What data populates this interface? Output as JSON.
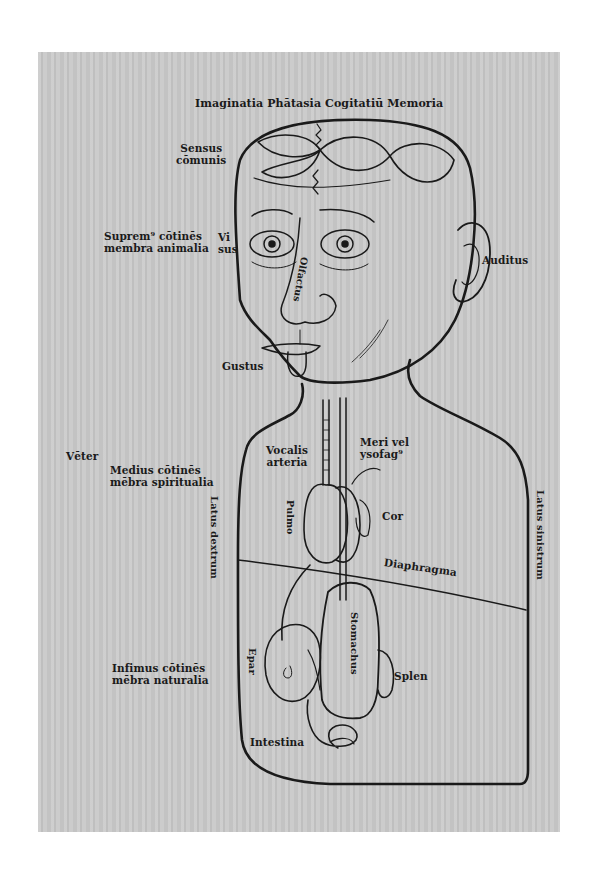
{
  "illustration": {
    "type": "woodcut anatomical diagram",
    "colors": {
      "page_background": "#ffffff",
      "paper": "#c9c9c9",
      "ink": "#1a1a1a"
    },
    "labels": {
      "brain_ventricles": "Imaginatia Phātasia Cogitatiū Memoria",
      "sensus_communis": [
        "Sensus",
        "cōmunis"
      ],
      "supremus": [
        "Suprem⁹ cōtinēs",
        "membra animalia"
      ],
      "visus": [
        "Vi",
        "sus"
      ],
      "olfactus": "Olfactus",
      "auditus": "Auditus",
      "gustus": "Gustus",
      "venter": "Vēter",
      "medius": [
        "Medius cōtinēs",
        "mēbra spiritualia"
      ],
      "vocalis_arteria": [
        "Vocalis",
        "arteria"
      ],
      "meri_vel_ysofagus": [
        "Meri vel",
        "ysofag⁹"
      ],
      "pulmo": "Pulmo",
      "cor": "Cor",
      "latus_dextrum": "Latus dextrum",
      "latus_sinistrum": "Latus sinistrum",
      "diaphragma": "Diaphragma",
      "stomachus": "Stomachus",
      "epar": "Epar",
      "splen": "Splen",
      "infimus": [
        "Infimus cōtinēs",
        "mēbra naturalia"
      ],
      "intestina": "Intestina"
    }
  }
}
